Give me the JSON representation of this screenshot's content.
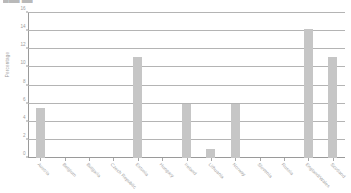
{
  "cutoff_title": "▆▆▆ ▆▆",
  "chart_data": {
    "type": "bar",
    "title": "",
    "xlabel": "",
    "ylabel": "Percentage",
    "ylim": [
      0,
      16
    ],
    "ytick_values": [
      0,
      2,
      4,
      6,
      8,
      10,
      12,
      14,
      16
    ],
    "ytick_labels": [
      "0",
      "2",
      "4",
      "6",
      "8",
      "10",
      "12",
      "14",
      "16"
    ],
    "grid": true,
    "legend": "none",
    "bar_color": "#c6c6c6",
    "categories": [
      "Austria",
      "Belgium",
      "Bulgaria",
      "Czech Republic",
      "Estonia",
      "Hungary",
      "Ireland",
      "Lithuania",
      "Norway",
      "Slovenia",
      "Russia",
      "England/Wales",
      "Scotland"
    ],
    "values": [
      5.5,
      0,
      0,
      0,
      11.2,
      0,
      6.0,
      1.0,
      6.0,
      0,
      0,
      14.2,
      11.2
    ]
  },
  "axes": {
    "y_title": "Percentage"
  }
}
